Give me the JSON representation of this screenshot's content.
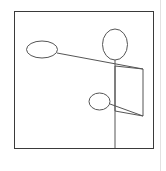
{
  "canvas": {
    "width": 166,
    "height": 171,
    "background_color": "#ffffff",
    "title": "line-drawing-figure"
  },
  "colors": {
    "stroke": "#555555",
    "frame_stroke": "#3a3a3a",
    "page_edge_stroke": "#e2e2e2",
    "background": "#ffffff"
  },
  "frame": {
    "name": "outer-square-frame",
    "x": 14,
    "y": 11,
    "width": 139,
    "height": 137,
    "stroke_width": 1
  },
  "page_edges": [
    {
      "name": "page-right-edge",
      "x1": 160.5,
      "y1": 0,
      "x2": 160.5,
      "y2": 171,
      "stroke_width": 1
    }
  ],
  "ellipses": [
    {
      "name": "left-ellipse",
      "cx": 42,
      "cy": 49.5,
      "rx": 15.5,
      "ry": 8.5,
      "stroke_width": 1
    },
    {
      "name": "top-right-ellipse",
      "cx": 115,
      "cy": 44.5,
      "rx": 12.5,
      "ry": 15.5,
      "stroke_width": 1
    },
    {
      "name": "small-middle-ellipse",
      "cx": 99.5,
      "cy": 101.5,
      "rx": 10.5,
      "ry": 8.5,
      "stroke_width": 1
    }
  ],
  "lines": [
    {
      "name": "upper-diagonal-connector",
      "x1": 57,
      "y1": 53,
      "x2": 143,
      "y2": 69,
      "stroke_width": 1
    },
    {
      "name": "lower-diagonal-connector",
      "x1": 110,
      "y1": 104,
      "x2": 143,
      "y2": 116,
      "stroke_width": 1
    },
    {
      "name": "vertical-stem-line",
      "x1": 115,
      "y1": 60,
      "x2": 115,
      "y2": 148,
      "stroke_width": 1
    }
  ],
  "polygons": [
    {
      "name": "quadrilateral-panel",
      "points": "115,66 143,69 143,116 115,111",
      "stroke_width": 1
    }
  ],
  "chart_data": {
    "type": "diagram",
    "elements": [
      {
        "kind": "square-frame",
        "label": "outer-square-frame"
      },
      {
        "kind": "ellipse",
        "label": "left-ellipse"
      },
      {
        "kind": "ellipse",
        "label": "top-right-ellipse"
      },
      {
        "kind": "ellipse",
        "label": "small-middle-ellipse"
      },
      {
        "kind": "line",
        "label": "upper-diagonal-connector"
      },
      {
        "kind": "line",
        "label": "lower-diagonal-connector"
      },
      {
        "kind": "line",
        "label": "vertical-stem-line"
      },
      {
        "kind": "polygon",
        "label": "quadrilateral-panel"
      }
    ]
  }
}
